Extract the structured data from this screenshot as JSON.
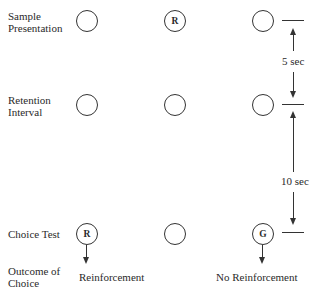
{
  "rows": {
    "sample": {
      "label_line1": "Sample",
      "label_line2": "Presentation",
      "circles": [
        "",
        "R",
        ""
      ]
    },
    "retention": {
      "label_line1": "Retention",
      "label_line2": "Interval",
      "circles": [
        "",
        "",
        ""
      ]
    },
    "choice": {
      "label": "Choice Test",
      "circles": [
        "R",
        "",
        "G"
      ]
    },
    "outcome": {
      "label_line1": "Outcome of",
      "label_line2": "Choice",
      "left": "Reinforcement",
      "right": "No Reinforcement"
    }
  },
  "intervals": {
    "first": "5 sec",
    "second": "10 sec"
  }
}
